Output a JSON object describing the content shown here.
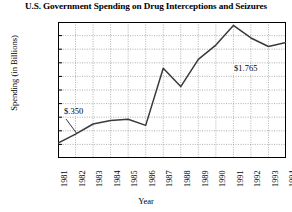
{
  "chart_data": {
    "type": "line",
    "title": "U.S. Government Spending on Drug Interceptions and Seizures",
    "xlabel": "Year",
    "ylabel": "Spending (in Billions)",
    "categories": [
      "1981",
      "1982",
      "1983",
      "1984",
      "1985",
      "1986",
      "1987",
      "1988",
      "1989",
      "1990",
      "1991",
      "1992",
      "1993",
      "1994"
    ],
    "values": [
      0.22,
      0.35,
      0.5,
      0.55,
      0.57,
      0.48,
      1.32,
      1.05,
      1.45,
      1.66,
      1.95,
      1.765,
      1.64,
      1.7
    ],
    "ylim": [
      0,
      2.0
    ],
    "ytick_labels": [
      "$2.0",
      "$1.8",
      "$1.6",
      "$1.4",
      "$1.2",
      "$1.0",
      "$0.8",
      "$0.6",
      "$0.4",
      "$0.2",
      "0"
    ],
    "ytick_values": [
      2.0,
      1.8,
      1.6,
      1.4,
      1.2,
      1.0,
      0.8,
      0.6,
      0.4,
      0.2,
      0
    ],
    "grid": true,
    "legend": null,
    "annotations": [
      {
        "text": "$.350",
        "point_category": "1982",
        "point_value": 0.35
      },
      {
        "text": "$1.765",
        "point_category": "1992",
        "point_value": 1.765
      }
    ],
    "line_color": "#3a3a3a"
  }
}
